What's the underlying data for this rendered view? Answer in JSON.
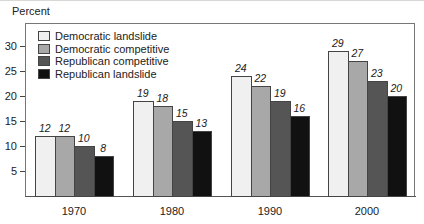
{
  "chart_data": {
    "type": "bar",
    "title": "",
    "ylabel": "Percent",
    "xlabel": "",
    "ylim": [
      0,
      34
    ],
    "yticks": [
      5,
      10,
      15,
      20,
      25,
      30
    ],
    "grid": false,
    "legend_position": "top-left inside",
    "categories": [
      "1970",
      "1980",
      "1990",
      "2000"
    ],
    "series": [
      {
        "name": "Democratic landslide",
        "color": "#f0f0f0",
        "values": [
          12,
          19,
          24,
          29
        ]
      },
      {
        "name": "Democratic competitive",
        "color": "#a8a8a8",
        "values": [
          12,
          18,
          22,
          27
        ]
      },
      {
        "name": "Republican competitive",
        "color": "#555555",
        "values": [
          10,
          15,
          19,
          23
        ]
      },
      {
        "name": "Republican landslide",
        "color": "#111111",
        "values": [
          8,
          13,
          16,
          20
        ]
      }
    ]
  },
  "layout": {
    "plot_left": 25,
    "baseline_y": 196,
    "px_per_unit": 5,
    "group_starts": [
      35,
      133,
      231,
      328
    ],
    "bar_width": 19.5
  }
}
